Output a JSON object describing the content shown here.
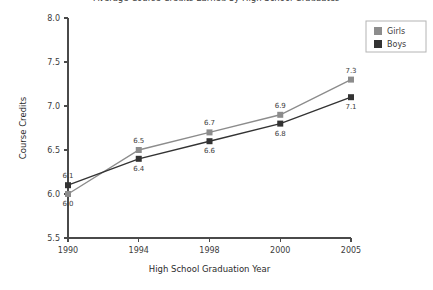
{
  "chart_data": {
    "type": "line",
    "title": "Average Course Credits Earned by High School Graduates",
    "xlabel": "High School Graduation Year",
    "ylabel": "Course Credits",
    "categories": [
      "1990",
      "1994",
      "1998",
      "2000",
      "2005"
    ],
    "ylim": [
      5.5,
      8.0
    ],
    "yticks": [
      "5.5",
      "6.0",
      "6.5",
      "7.0",
      "7.5",
      "8.0"
    ],
    "ytick_values": [
      5.5,
      6.0,
      6.5,
      7.0,
      7.5,
      8.0
    ],
    "grid": false,
    "legend_position": "top-right",
    "series": [
      {
        "name": "Girls",
        "color": "#8c8c8c",
        "values": [
          6.0,
          6.5,
          6.7,
          6.9,
          7.3
        ],
        "labels": [
          "6.0",
          "6.5",
          "6.7",
          "6.9",
          "7.3"
        ],
        "label_side": [
          "below",
          "above",
          "above",
          "above",
          "above"
        ]
      },
      {
        "name": "Boys",
        "color": "#333333",
        "values": [
          6.1,
          6.4,
          6.6,
          6.8,
          7.1
        ],
        "labels": [
          "6.1",
          "6.4",
          "6.6",
          "6.8",
          "7.1"
        ],
        "label_side": [
          "above",
          "below",
          "below",
          "below",
          "below"
        ]
      }
    ]
  },
  "legend": {
    "items": [
      {
        "label": "Girls",
        "color": "#8c8c8c"
      },
      {
        "label": "Boys",
        "color": "#333333"
      }
    ]
  },
  "axes": {
    "x_title": "High School Graduation Year",
    "y_title": "Course Credits",
    "x_tick_labels": [
      "1990",
      "1994",
      "1998",
      "2000",
      "2005"
    ],
    "y_tick_labels": [
      "8.0",
      "7.5",
      "7.0",
      "6.5",
      "6.0",
      "5.5"
    ]
  },
  "title": "Average Course Credits Earned by High School Graduates"
}
